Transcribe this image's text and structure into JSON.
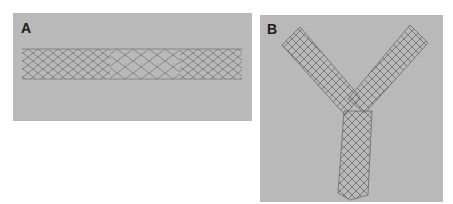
{
  "figure": {
    "panels": [
      {
        "label": "A",
        "content": "straight-stent-image",
        "background": "#b9b9b9"
      },
      {
        "label": "B",
        "content": "bifurcated-y-stent-image",
        "background": "#b9b9b9"
      }
    ]
  }
}
